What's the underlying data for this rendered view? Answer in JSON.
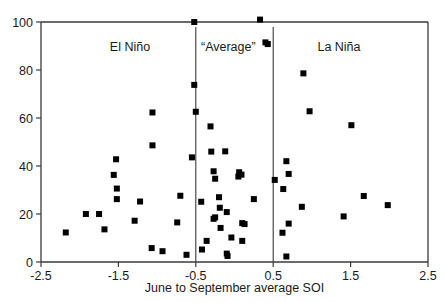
{
  "chart_data": {
    "type": "scatter",
    "title": "",
    "xlabel": "June to September average SOI",
    "ylabel": "",
    "xlim": [
      -2.5,
      2.5
    ],
    "ylim": [
      0,
      100
    ],
    "xticks": [
      "-2.5",
      "-1.5",
      "-0.5",
      "0.5",
      "1.5",
      "2.5"
    ],
    "xtick_values": [
      -2.5,
      -1.5,
      -0.5,
      0.5,
      1.5,
      2.5
    ],
    "yticks": [
      "0",
      "20",
      "40",
      "60",
      "80",
      "100"
    ],
    "ytick_values": [
      0,
      20,
      40,
      60,
      80,
      100
    ],
    "grid": false,
    "legend": "none",
    "marker": "square",
    "marker_color": "#000000",
    "annotations": [
      {
        "text": "El Niño",
        "x": -1.35,
        "y": 88
      },
      {
        "text": "“Average”",
        "x": -0.08,
        "y": 88
      },
      {
        "text": "La Niña",
        "x": 1.35,
        "y": 88
      }
    ],
    "reference_lines": [
      {
        "x": -0.5,
        "orientation": "vertical"
      },
      {
        "x": 0.5,
        "orientation": "vertical"
      }
    ],
    "points": [
      {
        "x": -2.18,
        "y": 12.3
      },
      {
        "x": -1.92,
        "y": 20.0
      },
      {
        "x": -1.75,
        "y": 20.0
      },
      {
        "x": -1.68,
        "y": 13.6
      },
      {
        "x": -1.56,
        "y": 36.3
      },
      {
        "x": -1.53,
        "y": 42.8
      },
      {
        "x": -1.52,
        "y": 30.6
      },
      {
        "x": -1.52,
        "y": 26.2
      },
      {
        "x": -1.29,
        "y": 17.2
      },
      {
        "x": -1.22,
        "y": 25.2
      },
      {
        "x": -1.06,
        "y": 62.3
      },
      {
        "x": -1.06,
        "y": 48.6
      },
      {
        "x": -1.07,
        "y": 5.8
      },
      {
        "x": -0.93,
        "y": 4.5
      },
      {
        "x": -0.74,
        "y": 16.5
      },
      {
        "x": -0.7,
        "y": 27.6
      },
      {
        "x": -0.62,
        "y": 3.0
      },
      {
        "x": -0.55,
        "y": 43.6
      },
      {
        "x": -0.52,
        "y": 100.0
      },
      {
        "x": -0.52,
        "y": 73.8
      },
      {
        "x": -0.5,
        "y": 62.6
      },
      {
        "x": -0.43,
        "y": 25.1
      },
      {
        "x": -0.42,
        "y": 5.2
      },
      {
        "x": -0.36,
        "y": 8.8
      },
      {
        "x": -0.31,
        "y": 56.5
      },
      {
        "x": -0.3,
        "y": 46.0
      },
      {
        "x": -0.27,
        "y": 37.8
      },
      {
        "x": -0.25,
        "y": 34.7
      },
      {
        "x": -0.25,
        "y": 18.6
      },
      {
        "x": -0.27,
        "y": 18.0
      },
      {
        "x": -0.2,
        "y": 27.0
      },
      {
        "x": -0.19,
        "y": 22.6
      },
      {
        "x": -0.18,
        "y": 14.2
      },
      {
        "x": -0.12,
        "y": 46.1
      },
      {
        "x": -0.1,
        "y": 20.8
      },
      {
        "x": -0.1,
        "y": 3.5
      },
      {
        "x": -0.09,
        "y": 2.5
      },
      {
        "x": -0.04,
        "y": 10.2
      },
      {
        "x": 0.06,
        "y": 37.4
      },
      {
        "x": 0.05,
        "y": 35.6
      },
      {
        "x": 0.09,
        "y": 36.4
      },
      {
        "x": 0.1,
        "y": 16.2
      },
      {
        "x": 0.13,
        "y": 15.8
      },
      {
        "x": 0.1,
        "y": 8.8
      },
      {
        "x": 0.25,
        "y": 26.2
      },
      {
        "x": 0.33,
        "y": 101.0
      },
      {
        "x": 0.4,
        "y": 91.5
      },
      {
        "x": 0.43,
        "y": 90.8
      },
      {
        "x": 0.52,
        "y": 34.2
      },
      {
        "x": 0.67,
        "y": 42.0
      },
      {
        "x": 0.7,
        "y": 36.7
      },
      {
        "x": 0.63,
        "y": 30.4
      },
      {
        "x": 0.7,
        "y": 16.0
      },
      {
        "x": 0.62,
        "y": 12.2
      },
      {
        "x": 0.67,
        "y": 2.3
      },
      {
        "x": 0.89,
        "y": 78.6
      },
      {
        "x": 0.97,
        "y": 62.8
      },
      {
        "x": 0.87,
        "y": 23.0
      },
      {
        "x": 1.41,
        "y": 19.0
      },
      {
        "x": 1.51,
        "y": 57.0
      },
      {
        "x": 1.67,
        "y": 27.5
      },
      {
        "x": 1.98,
        "y": 23.7
      }
    ]
  },
  "axes": {
    "x_axis_title": "June to September average SOI"
  }
}
